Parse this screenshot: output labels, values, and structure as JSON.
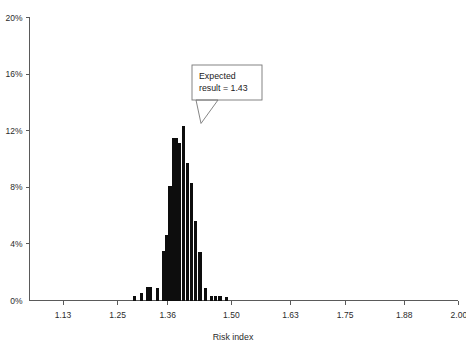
{
  "chart_data": {
    "type": "bar",
    "title": "",
    "subtitle": "",
    "xlabel": "Risk index",
    "ylabel": "",
    "xlim": [
      1.055,
      2.0
    ],
    "ylim": [
      0,
      20
    ],
    "grid": false,
    "legend": null,
    "x_tick_labels": [
      "1.13",
      "1.25",
      "1.36",
      "1.50",
      "1.63",
      "1.75",
      "1.88",
      "2.00"
    ],
    "x_tick_values": [
      1.13,
      1.25,
      1.36,
      1.5,
      1.63,
      1.75,
      1.88,
      2.0
    ],
    "y_tick_labels": [
      "0%",
      "4%",
      "8%",
      "12%",
      "16%",
      "20%"
    ],
    "y_tick_values": [
      0,
      4,
      8,
      12,
      16,
      20
    ],
    "y_unit": "%",
    "x": [
      1.29,
      1.297,
      1.304,
      1.311,
      1.318,
      1.325,
      1.332,
      1.339,
      1.346,
      1.353,
      1.36,
      1.367,
      1.374,
      1.381,
      1.388,
      1.395,
      1.402,
      1.409,
      1.416,
      1.423,
      1.43,
      1.437,
      1.444,
      1.451,
      1.458,
      1.465,
      1.472,
      1.479,
      1.486,
      1.493,
      1.5,
      1.507,
      1.514,
      1.521,
      1.528,
      1.535,
      1.542,
      1.549,
      1.556
    ],
    "values": [
      0.0,
      0.35,
      0.0,
      0.55,
      0.0,
      0.95,
      0.95,
      0.0,
      0.85,
      0.0,
      3.5,
      0.0,
      4.6,
      0.0,
      8.1,
      0.0,
      11.5,
      11.5,
      11.1,
      0.0,
      12.3,
      0.0,
      9.7,
      0.0,
      8.3,
      0.0,
      5.6,
      0.0,
      3.4,
      0.0,
      0.9,
      0.0,
      0.35,
      0.3,
      0.3,
      0.0,
      0.25,
      0.0,
      0.0
    ],
    "bars": [
      {
        "x": 1.288,
        "value": 0.35
      },
      {
        "x": 1.302,
        "value": 0.55
      },
      {
        "x": 1.316,
        "value": 0.95
      },
      {
        "x": 1.323,
        "value": 0.95
      },
      {
        "x": 1.337,
        "value": 0.85
      },
      {
        "x": 1.351,
        "value": 3.5
      },
      {
        "x": 1.358,
        "value": 4.6
      },
      {
        "x": 1.365,
        "value": 8.1
      },
      {
        "x": 1.372,
        "value": 11.5
      },
      {
        "x": 1.379,
        "value": 11.5
      },
      {
        "x": 1.386,
        "value": 11.1
      },
      {
        "x": 1.395,
        "value": 12.3
      },
      {
        "x": 1.404,
        "value": 9.7
      },
      {
        "x": 1.413,
        "value": 8.3
      },
      {
        "x": 1.422,
        "value": 5.6
      },
      {
        "x": 1.431,
        "value": 3.4
      },
      {
        "x": 1.443,
        "value": 0.9
      },
      {
        "x": 1.457,
        "value": 0.35
      },
      {
        "x": 1.466,
        "value": 0.3
      },
      {
        "x": 1.475,
        "value": 0.3
      },
      {
        "x": 1.489,
        "value": 0.25
      }
    ],
    "annotations": [
      {
        "name": "expected-result-callout",
        "line1": "Expected",
        "line2": "result = 1.43",
        "points_to_x": 1.43,
        "points_to_value": 12.3
      }
    ],
    "colors": {
      "bar": "#0d0d0d",
      "axis": "#5a5a5a",
      "text": "#2b2b2b",
      "callout_border": "#777777",
      "background": "#ffffff"
    }
  }
}
